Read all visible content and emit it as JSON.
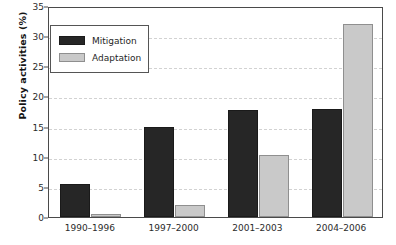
{
  "chart_data": {
    "type": "bar",
    "title": "",
    "xlabel": "",
    "ylabel": "Policy activities (%)",
    "ylim": [
      0,
      35
    ],
    "ytick_labels": [
      "0",
      "5",
      "10",
      "15",
      "20",
      "25",
      "30",
      "35"
    ],
    "yticks": [
      0,
      5,
      10,
      15,
      20,
      25,
      30,
      35
    ],
    "grid": "horizontal-dashed",
    "legend_position": "upper-left-inside",
    "categories": [
      "1990–1996",
      "1997–2000",
      "2001–2003",
      "2004–2006"
    ],
    "series": [
      {
        "name": "Mitigation",
        "color": "#262626",
        "values": [
          5.5,
          15.0,
          17.8,
          18.0
        ]
      },
      {
        "name": "Adaptation",
        "color": "#c9c9c9",
        "values": [
          0.5,
          2.0,
          10.3,
          32.0
        ]
      }
    ]
  },
  "legend": {
    "entries": [
      {
        "label": "Mitigation",
        "swatch": "mitigation"
      },
      {
        "label": "Adaptation",
        "swatch": "adaptation"
      }
    ]
  }
}
